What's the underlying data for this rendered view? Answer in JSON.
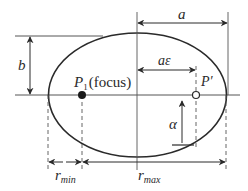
{
  "diagram": {
    "colors": {
      "stroke": "#2a2a2a",
      "guide": "#555555",
      "background": "#ffffff"
    },
    "labels": {
      "semi_major": "a",
      "semi_minor": "b",
      "focal_distance": "aε",
      "focus_point": "P",
      "focus_subscript": "1",
      "focus_note": "(focus)",
      "other_focus": "P′",
      "angle": "α",
      "r_min_main": "r",
      "r_min_sub": "min",
      "r_max_main": "r",
      "r_max_sub": "max"
    }
  }
}
